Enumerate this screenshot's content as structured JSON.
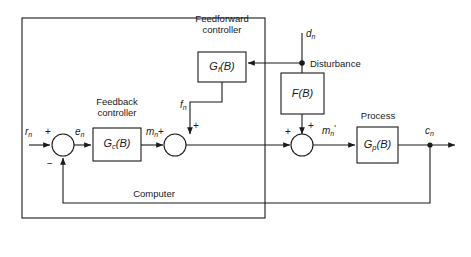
{
  "figure": {
    "type": "block-diagram",
    "domain": "control-systems",
    "background": "#ffffff",
    "line_color": "#1a1a1a",
    "text_color": "#1a1a1a"
  },
  "boundary": {
    "label": "Computer"
  },
  "captions": {
    "feedforward_line1": "Feedforward",
    "feedforward_line2": "controller",
    "feedback_line1": "Feedback",
    "feedback_line2": "controller",
    "disturbance": "Disturbance",
    "process": "Process"
  },
  "blocks": {
    "feedforward_controller": {
      "name": "G",
      "sub": "f",
      "arg": "(B)"
    },
    "feedback_controller": {
      "name": "G",
      "sub": "c",
      "arg": "(B)"
    },
    "disturbance_filter": {
      "name": "F",
      "sub": "",
      "arg": "(B)"
    },
    "process": {
      "name": "G",
      "sub": "p",
      "arg": "(B)"
    }
  },
  "signals": {
    "reference": {
      "name": "r",
      "sub": "n"
    },
    "error": {
      "name": "e",
      "sub": "n"
    },
    "controller_output": {
      "name": "m",
      "sub": "n"
    },
    "feedforward_output": {
      "name": "f",
      "sub": "n"
    },
    "combined_input": {
      "name": "m",
      "sub": "n",
      "prime": "'"
    },
    "disturbance": {
      "name": "d",
      "sub": "n"
    },
    "output": {
      "name": "c",
      "sub": "n"
    }
  },
  "summing_junctions": [
    {
      "id": "junction-error",
      "signs": {
        "left": "+",
        "bottom": "−"
      }
    },
    {
      "id": "junction-control",
      "signs": {
        "left": "+",
        "top": "+"
      }
    },
    {
      "id": "junction-process-input",
      "signs": {
        "left": "+",
        "top": "+"
      }
    }
  ]
}
